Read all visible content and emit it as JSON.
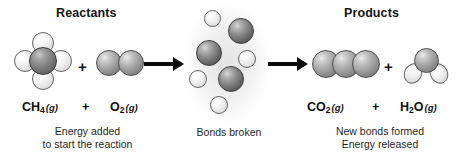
{
  "diagram": {
    "title_left": "Reactants",
    "title_right": "Products",
    "plus_molecule_left": "+",
    "plus_molecule_right": "+",
    "plus_formula_left": "+",
    "plus_formula_right": "+"
  },
  "formulas": {
    "ch4": {
      "symbol": "CH",
      "sub": "4",
      "state": "(g)"
    },
    "o2": {
      "symbol": "O",
      "sub": "2",
      "state": "(g)"
    },
    "co2": {
      "symbol": "CO",
      "sub": "2",
      "state": "(g)"
    },
    "h2o": {
      "symbol": "H",
      "sub": "2",
      "symbol2": "O",
      "state": "(g)"
    }
  },
  "captions": {
    "left_line1": "Energy added",
    "left_line2": "to start the reaction",
    "middle": "Bonds broken",
    "right_line1": "New bonds formed",
    "right_line2": "Energy released"
  },
  "colors": {
    "background": "#ffffff",
    "text": "#111111",
    "arrow": "#0b0b0b",
    "atom_dark": "#6d6d6d",
    "atom_mid": "#949494",
    "atom_light": "#f0f0f0",
    "atom_carbon": "#707070",
    "cluster_glow": "#e9e9e9"
  },
  "molecules": {
    "methane": {
      "name": "methane",
      "center_atom": "carbon",
      "outer_atoms": 4,
      "outer_atom": "hydrogen"
    },
    "oxygen": {
      "name": "oxygen-gas",
      "atoms": 2
    },
    "carbon_dioxide": {
      "name": "carbon-dioxide",
      "atoms": 3
    },
    "water": {
      "name": "water",
      "atoms": 3
    },
    "cluster": {
      "name": "broken-bonds-cluster",
      "dark_atoms": 3,
      "light_atoms": 4
    }
  },
  "arrows": {
    "first": "reaction-arrow-forward",
    "second": "reaction-arrow-forward"
  }
}
